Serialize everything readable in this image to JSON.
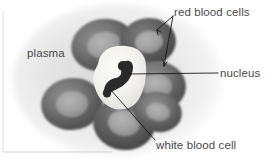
{
  "figure": {
    "type": "labeled-biology-diagram",
    "rendering": "grayscale shaded illustration",
    "background_color": "#ffffff",
    "plasma_color": "#ebebeb",
    "red_cell_rim_color": "#6b6b6b",
    "red_cell_center_color": "#9c9c9c",
    "white_cell_color": "#f4f3f0",
    "nucleus_color": "#2b2b2b",
    "leader_line_color": "#1a1a1a",
    "label_text_color": "#4a4a4a",
    "border_color": "#d8d8d8"
  },
  "labels": {
    "red_blood_cells": "red blood cells",
    "nucleus": "nucleus",
    "white_blood_cell": "white blood cell",
    "plasma": "plasma"
  },
  "structures": {
    "red_blood_cells": {
      "name": "red blood cells",
      "count": 6,
      "shape": "biconcave disc / torus",
      "description": "donut-shaped cells with dark rims and pale depressed centres clustered around the white blood cell"
    },
    "white_blood_cell": {
      "name": "white blood cell",
      "count": 1,
      "shape": "irregular rounded blob",
      "description": "large pale cell at the centre of the cluster"
    },
    "nucleus": {
      "name": "nucleus",
      "belongs_to": "white blood cell",
      "shape": "dark multi-lobed curved band",
      "description": "dark lobed nucleus inside the white blood cell"
    },
    "plasma": {
      "name": "plasma",
      "description": "pale grey fluid background surrounding all cells"
    }
  },
  "leader_lines": [
    {
      "label": "red blood cells",
      "arrowheads": 2,
      "targets": [
        "upper-right red blood cell",
        "right red blood cell"
      ]
    },
    {
      "label": "nucleus",
      "arrowheads": 0,
      "targets": [
        "nucleus of white blood cell"
      ]
    },
    {
      "label": "white blood cell",
      "arrowheads": 0,
      "targets": [
        "white blood cell body"
      ]
    },
    {
      "label": "plasma",
      "arrowheads": 0,
      "targets": []
    }
  ]
}
